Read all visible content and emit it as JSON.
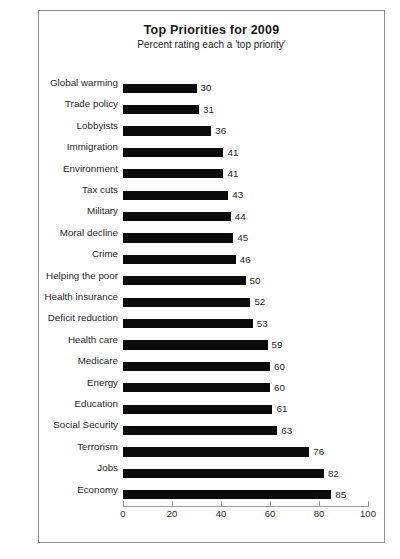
{
  "chart_data": {
    "type": "bar",
    "orientation": "horizontal",
    "title": "Top Priorities for 2009",
    "subtitle": "Percent rating each a 'top priority'",
    "xlabel": "",
    "ylabel": "",
    "xlim": [
      0,
      100
    ],
    "xticks": [
      "0",
      "20",
      "40",
      "60",
      "80",
      "100"
    ],
    "grid": false,
    "legend": "none",
    "bar_color": "#0b0b0b",
    "categories": [
      "Global warming",
      "Trade policy",
      "Lobbyists",
      "Immigration",
      "Environment",
      "Tax cuts",
      "Military",
      "Moral decline",
      "Crime",
      "Helping the poor",
      "Health insurance",
      "Deficit reduction",
      "Health care",
      "Medicare",
      "Energy",
      "Education",
      "Social Security",
      "Terrorism",
      "Jobs",
      "Economy"
    ],
    "values": [
      30,
      31,
      36,
      41,
      41,
      43,
      44,
      45,
      46,
      50,
      52,
      53,
      59,
      60,
      60,
      61,
      63,
      76,
      82,
      85
    ],
    "data_labels": [
      "30",
      "31",
      "36",
      "41",
      "41",
      "43",
      "44",
      "45",
      "46",
      "50",
      "52",
      "53",
      "59",
      "60",
      "60",
      "61",
      "63",
      "76",
      "82",
      "85"
    ]
  },
  "caption": ""
}
